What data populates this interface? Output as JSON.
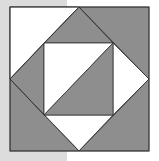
{
  "figure": {
    "title": "",
    "type": "quilt-block-geometric-pattern",
    "colors": {
      "fill_dark": "#8e8e8e",
      "fill_light": "#ffffff",
      "stroke": "#333333",
      "page_bg_left": "#dcdcdc",
      "page_bg_right": "#ffffff"
    },
    "outer_square": {
      "x1": 10,
      "y1": 7,
      "x2": 149,
      "y2": 151
    },
    "inner_square": {
      "x1": 44,
      "y1": 43,
      "x2": 113,
      "y2": 115
    },
    "regions": [
      {
        "name": "corner-top-left",
        "fill": "light"
      },
      {
        "name": "corner-top-right",
        "fill": "dark"
      },
      {
        "name": "corner-bottom-right",
        "fill": "dark"
      },
      {
        "name": "corner-bottom-left",
        "fill": "dark"
      },
      {
        "name": "diamond-top",
        "fill": "dark"
      },
      {
        "name": "diamond-right",
        "fill": "light"
      },
      {
        "name": "diamond-bottom",
        "fill": "light"
      },
      {
        "name": "diamond-left",
        "fill": "dark"
      },
      {
        "name": "inner-upper-left-triangle",
        "fill": "light"
      },
      {
        "name": "inner-lower-right-triangle",
        "fill": "dark"
      }
    ]
  }
}
